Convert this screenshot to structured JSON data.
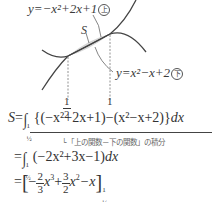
{
  "graph": {
    "upper_curve": {
      "equation": "y=−x²+2x+1",
      "marker": "上",
      "color": "#444444"
    },
    "lower_curve": {
      "equation": "y=x²−x+2",
      "marker": "下",
      "color": "#444444"
    },
    "region_label": "S",
    "region_fill": "#d6d6d6",
    "x_ticks": [
      {
        "label_num": "1",
        "label_den": "2",
        "value": 0.5
      },
      {
        "label": "1",
        "value": 1
      }
    ]
  },
  "solution": {
    "line1": {
      "lhs": "S",
      "eq": "=",
      "lower_limit": "½",
      "upper_limit": "1",
      "integrand": "{(−x²+2x+1)−(x²−x+2)}",
      "dx": "dx"
    },
    "annotation": "└「上の関数－下の関数」の積分",
    "line2": {
      "eq": "=",
      "lower_limit": "½",
      "upper_limit": "1",
      "integrand": "(−2x²+3x−1)",
      "dx": "dx"
    },
    "line3": {
      "eq": "=",
      "antiderivative": "[−(2/3)x³+(3/2)x²−x]",
      "lower_limit": "½",
      "upper_limit": "1",
      "term1_sign": "−",
      "term1_num": "2",
      "term1_den": "3",
      "term2_sign": "+",
      "term2_num": "3",
      "term2_den": "2",
      "term3": "−x"
    }
  }
}
